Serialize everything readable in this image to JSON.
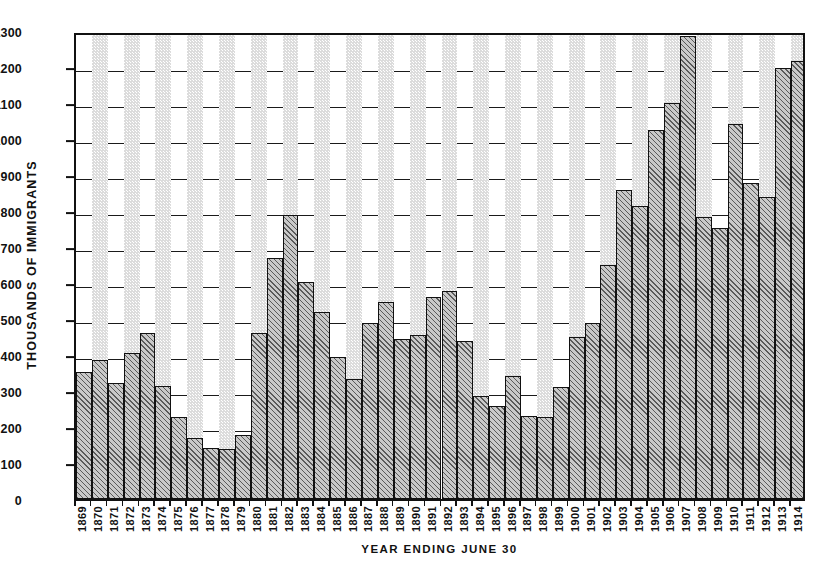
{
  "chart_data": {
    "type": "bar",
    "title": "",
    "xlabel": "YEAR ENDING JUNE 30",
    "ylabel": "THOUSANDS OF IMMIGRANTS",
    "ylim": [
      0,
      1300
    ],
    "ytick_step": 100,
    "yticks": [
      0,
      100,
      200,
      300,
      400,
      500,
      600,
      700,
      800,
      900,
      1000,
      1100,
      1200,
      1300
    ],
    "grid": true,
    "legend": "none",
    "units": "thousands of immigrants",
    "categories": [
      "1869",
      "1870",
      "1871",
      "1872",
      "1873",
      "1874",
      "1875",
      "1876",
      "1877",
      "1878",
      "1879",
      "1880",
      "1881",
      "1882",
      "1883",
      "1884",
      "1885",
      "1886",
      "1887",
      "1888",
      "1889",
      "1890",
      "1891",
      "1892",
      "1893",
      "1894",
      "1895",
      "1896",
      "1897",
      "1898",
      "1899",
      "1900",
      "1901",
      "1902",
      "1903",
      "1904",
      "1905",
      "1906",
      "1907",
      "1908",
      "1909",
      "1910",
      "1911",
      "1912",
      "1913",
      "1914"
    ],
    "values": [
      353,
      387,
      321,
      405,
      460,
      313,
      227,
      170,
      142,
      138,
      178,
      460,
      669,
      789,
      603,
      519,
      395,
      334,
      490,
      547,
      444,
      455,
      560,
      579,
      440,
      285,
      259,
      343,
      231,
      229,
      312,
      449,
      488,
      649,
      857,
      813,
      1026,
      1101,
      1285,
      783,
      752,
      1041,
      878,
      838,
      1198,
      1218
    ],
    "colors": {
      "bar_fill": "#c9c9c9",
      "bar_hatch": "#5a5a5a",
      "bar_edge": "#111111",
      "band_shaded": "#dcdcdc",
      "band_plain": "#ffffff",
      "axis": "#111111",
      "text": "#111111"
    }
  }
}
